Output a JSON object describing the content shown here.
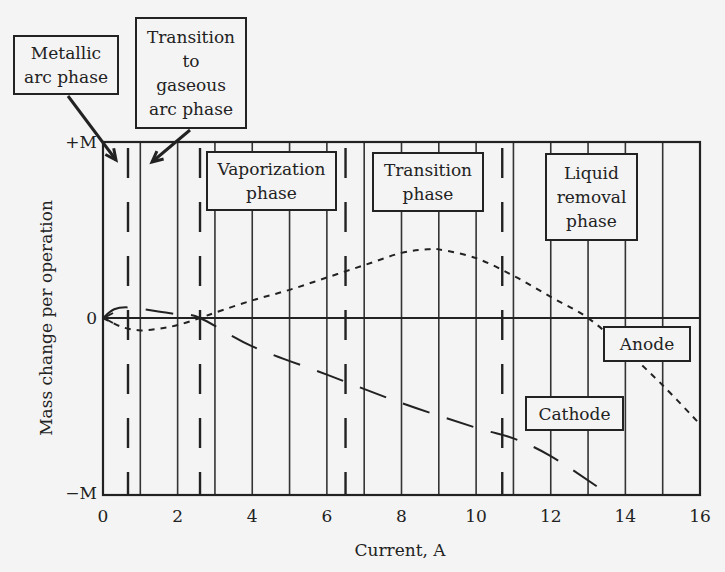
{
  "chart_data": {
    "type": "line",
    "title": "",
    "xlabel": "Current, A",
    "ylabel": "Mass change per operation",
    "xlim": [
      0,
      16
    ],
    "ylim": [
      -1,
      1
    ],
    "x_ticks": [
      "0",
      "2",
      "4",
      "6",
      "8",
      "10",
      "12",
      "14",
      "16"
    ],
    "y_ticks": [
      "+M",
      "0",
      "−M"
    ],
    "grid": {
      "vertical_solid_every": 1,
      "horizontal": false
    },
    "phase_boundaries_dashed": [
      0.67,
      2.6,
      6.5,
      10.7
    ],
    "series": [
      {
        "name": "Anode",
        "style": "dashed",
        "x": [
          0,
          0.5,
          1,
          1.5,
          2,
          2.6,
          3,
          4,
          5,
          6,
          7,
          8,
          8.7,
          9,
          10,
          11,
          12,
          13,
          14,
          15,
          16
        ],
        "values": [
          0,
          -0.05,
          -0.07,
          -0.06,
          -0.04,
          0,
          0.03,
          0.1,
          0.16,
          0.23,
          0.3,
          0.37,
          0.39,
          0.39,
          0.34,
          0.24,
          0.12,
          0,
          -0.18,
          -0.38,
          -0.6
        ]
      },
      {
        "name": "Cathode",
        "style": "long-dash",
        "x": [
          0,
          0.3,
          0.7,
          1.4,
          2,
          2.6,
          4,
          6,
          8,
          10,
          11,
          12,
          13.3
        ],
        "values": [
          0,
          0.05,
          0.06,
          0.04,
          0.02,
          0,
          -0.16,
          -0.32,
          -0.48,
          -0.62,
          -0.68,
          -0.78,
          -0.96
        ]
      }
    ],
    "annotations": [
      {
        "id": "metallic",
        "lines": [
          "Metallic",
          "arc phase"
        ],
        "points_to_x": 0.67
      },
      {
        "id": "transition-gaseous",
        "lines": [
          "Transition",
          "to",
          "gaseous",
          "arc phase"
        ],
        "points_to_x": 1.0
      },
      {
        "id": "vaporization",
        "lines": [
          "Vaporization",
          "phase"
        ]
      },
      {
        "id": "transition",
        "lines": [
          "Transition",
          "phase"
        ]
      },
      {
        "id": "liquid",
        "lines": [
          "Liquid",
          "removal",
          "phase"
        ]
      },
      {
        "id": "anode",
        "lines": [
          "Anode"
        ]
      },
      {
        "id": "cathode",
        "lines": [
          "Cathode"
        ]
      }
    ]
  }
}
